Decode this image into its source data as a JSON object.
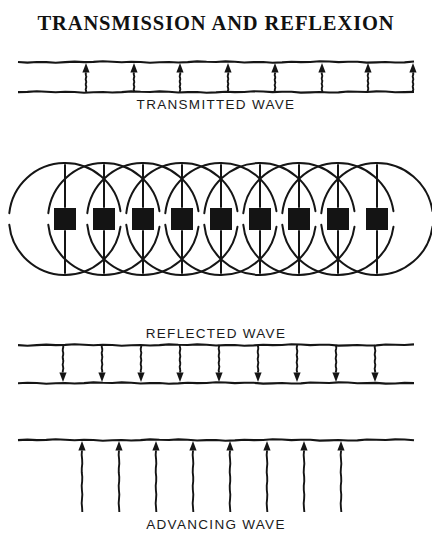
{
  "figure": {
    "title": "TRANSMISSION AND REFLEXION",
    "width": 432,
    "height": 546,
    "ink_color": "#151515",
    "background_color": "#ffffff"
  },
  "chart_data": {
    "type": "diagram",
    "title": "TRANSMISSION AND REFLEXION",
    "ink_color": "#151515",
    "background_color": "#ffffff",
    "panels": [
      {
        "id": "transmitted",
        "label": "TRANSMITTED WAVE",
        "label_position": "below",
        "arrow_direction": "up",
        "arrow_count": 8,
        "top_rule_y": 62,
        "bottom_rule_y": 92,
        "rule_x_start": 18,
        "rule_x_end": 414,
        "arrow_x": [
          86,
          134,
          180,
          228,
          275,
          322,
          368,
          413
        ]
      },
      {
        "id": "wavelets",
        "label": "",
        "scatterer_count": 9,
        "scatterer_size": 22,
        "scatterer_center_y": 219,
        "scatterer_center_x": [
          65,
          104,
          143,
          182,
          221,
          260,
          299,
          338,
          377
        ],
        "wavelet_radius": 56,
        "description": "each scatterer radiates a circular wavelet above and below the sheet"
      },
      {
        "id": "reflected",
        "label": "REFLECTED WAVE",
        "label_position": "above",
        "arrow_direction": "down",
        "arrow_count": 9,
        "top_rule_y": 345,
        "bottom_rule_y": 383,
        "rule_x_start": 18,
        "rule_x_end": 414,
        "arrow_x": [
          63,
          102,
          141,
          180,
          219,
          258,
          297,
          336,
          375
        ]
      },
      {
        "id": "advancing",
        "label": "ADVANCING WAVE",
        "label_position": "below",
        "arrow_direction": "up",
        "arrow_count": 8,
        "top_rule_y": 440,
        "bottom_rule_y": null,
        "rule_x_start": 18,
        "rule_x_end": 414,
        "arrow_length": 72,
        "arrow_x": [
          82,
          119,
          156,
          193,
          230,
          267,
          304,
          341
        ]
      }
    ]
  }
}
